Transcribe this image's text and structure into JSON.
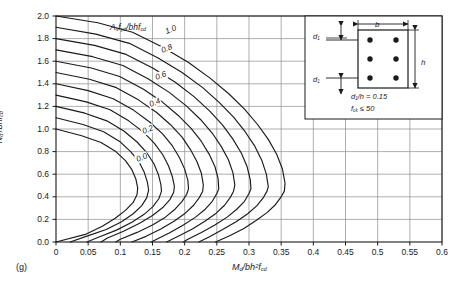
{
  "figure": {
    "panel_label": "(g)",
    "background": "#ffffff",
    "ink": "#1a1a1a",
    "grid_color": "#8c8c8c"
  },
  "chart_data": {
    "type": "line",
    "title": "",
    "subtitle": "",
    "xlabel": "Md/bh²fcd",
    "ylabel": "Nd/bhfcd",
    "xlim": [
      0,
      0.6
    ],
    "ylim": [
      0,
      2.0
    ],
    "xticks": [
      "0",
      "0.05",
      "0.1",
      "0.15",
      "0.2",
      "0.25",
      "0.3",
      "0.35",
      "0.4",
      "0.45",
      "0.5",
      "0.55",
      "0.6"
    ],
    "xtick_values": [
      0,
      0.05,
      0.1,
      0.15,
      0.2,
      0.25,
      0.3,
      0.35,
      0.4,
      0.45,
      0.5,
      0.55,
      0.6
    ],
    "yticks": [
      "0.0",
      "0.2",
      "0.4",
      "0.6",
      "0.8",
      "1.0",
      "1.2",
      "1.4",
      "1.6",
      "1.8",
      "2.0"
    ],
    "ytick_values": [
      0,
      0.2,
      0.4,
      0.6,
      0.8,
      1.0,
      1.2,
      1.4,
      1.6,
      1.8,
      2.0
    ],
    "grid": true,
    "legend_position": "inline-curve-labels",
    "family_label": "Asfyd/bhfcd",
    "labelled_curves": [
      "0.0",
      "0.2",
      "0.4",
      "0.6",
      "0.8",
      "1.0"
    ],
    "series": [
      {
        "name": "0.0",
        "label_shown": true,
        "points": [
          [
            0.0,
            1.0
          ],
          [
            0.04,
            0.94
          ],
          [
            0.07,
            0.88
          ],
          [
            0.093,
            0.8
          ],
          [
            0.108,
            0.72
          ],
          [
            0.118,
            0.64
          ],
          [
            0.124,
            0.56
          ],
          [
            0.127,
            0.48
          ],
          [
            0.126,
            0.42
          ],
          [
            0.12,
            0.35
          ],
          [
            0.108,
            0.28
          ],
          [
            0.092,
            0.21
          ],
          [
            0.072,
            0.14
          ],
          [
            0.047,
            0.07
          ],
          [
            0.0,
            0.0
          ]
        ]
      },
      {
        "name": "0.1",
        "label_shown": false,
        "points": [
          [
            0.0,
            1.1
          ],
          [
            0.042,
            1.04
          ],
          [
            0.074,
            0.975
          ],
          [
            0.099,
            0.89
          ],
          [
            0.116,
            0.8
          ],
          [
            0.129,
            0.71
          ],
          [
            0.137,
            0.62
          ],
          [
            0.142,
            0.53
          ],
          [
            0.144,
            0.46
          ],
          [
            0.141,
            0.39
          ],
          [
            0.133,
            0.32
          ],
          [
            0.12,
            0.25
          ],
          [
            0.102,
            0.18
          ],
          [
            0.078,
            0.11
          ],
          [
            0.047,
            0.05
          ],
          [
            0.022,
            0.0
          ]
        ]
      },
      {
        "name": "0.2",
        "label_shown": true,
        "points": [
          [
            0.0,
            1.2
          ],
          [
            0.045,
            1.14
          ],
          [
            0.079,
            1.072
          ],
          [
            0.106,
            0.98
          ],
          [
            0.126,
            0.885
          ],
          [
            0.141,
            0.79
          ],
          [
            0.152,
            0.695
          ],
          [
            0.159,
            0.6
          ],
          [
            0.163,
            0.51
          ],
          [
            0.164,
            0.45
          ],
          [
            0.16,
            0.385
          ],
          [
            0.151,
            0.315
          ],
          [
            0.137,
            0.245
          ],
          [
            0.118,
            0.175
          ],
          [
            0.094,
            0.105
          ],
          [
            0.065,
            0.04
          ],
          [
            0.048,
            0.0
          ]
        ]
      },
      {
        "name": "0.3",
        "label_shown": false,
        "points": [
          [
            0.0,
            1.3
          ],
          [
            0.047,
            1.24
          ],
          [
            0.084,
            1.17
          ],
          [
            0.113,
            1.072
          ],
          [
            0.136,
            0.972
          ],
          [
            0.153,
            0.872
          ],
          [
            0.166,
            0.772
          ],
          [
            0.175,
            0.672
          ],
          [
            0.181,
            0.575
          ],
          [
            0.184,
            0.495
          ],
          [
            0.183,
            0.44
          ],
          [
            0.177,
            0.375
          ],
          [
            0.166,
            0.305
          ],
          [
            0.15,
            0.235
          ],
          [
            0.13,
            0.165
          ],
          [
            0.105,
            0.095
          ],
          [
            0.08,
            0.035
          ],
          [
            0.07,
            0.0
          ]
        ]
      },
      {
        "name": "0.4",
        "label_shown": true,
        "points": [
          [
            0.0,
            1.4
          ],
          [
            0.05,
            1.34
          ],
          [
            0.089,
            1.268
          ],
          [
            0.121,
            1.165
          ],
          [
            0.146,
            1.06
          ],
          [
            0.166,
            0.955
          ],
          [
            0.181,
            0.85
          ],
          [
            0.192,
            0.745
          ],
          [
            0.2,
            0.645
          ],
          [
            0.205,
            0.545
          ],
          [
            0.206,
            0.47
          ],
          [
            0.203,
            0.42
          ],
          [
            0.196,
            0.36
          ],
          [
            0.185,
            0.29
          ],
          [
            0.17,
            0.22
          ],
          [
            0.15,
            0.15
          ],
          [
            0.126,
            0.085
          ],
          [
            0.1,
            0.025
          ],
          [
            0.093,
            0.0
          ]
        ]
      },
      {
        "name": "0.5",
        "label_shown": false,
        "points": [
          [
            0.0,
            1.5
          ],
          [
            0.052,
            1.44
          ],
          [
            0.094,
            1.366
          ],
          [
            0.128,
            1.258
          ],
          [
            0.156,
            1.148
          ],
          [
            0.178,
            1.038
          ],
          [
            0.196,
            0.928
          ],
          [
            0.209,
            0.818
          ],
          [
            0.219,
            0.712
          ],
          [
            0.226,
            0.608
          ],
          [
            0.229,
            0.505
          ],
          [
            0.228,
            0.45
          ],
          [
            0.223,
            0.395
          ],
          [
            0.214,
            0.325
          ],
          [
            0.201,
            0.255
          ],
          [
            0.184,
            0.185
          ],
          [
            0.163,
            0.115
          ],
          [
            0.14,
            0.05
          ],
          [
            0.118,
            0.0
          ]
        ]
      },
      {
        "name": "0.6",
        "label_shown": true,
        "points": [
          [
            0.0,
            1.6
          ],
          [
            0.055,
            1.54
          ],
          [
            0.099,
            1.464
          ],
          [
            0.136,
            1.352
          ],
          [
            0.166,
            1.236
          ],
          [
            0.19,
            1.12
          ],
          [
            0.21,
            1.005
          ],
          [
            0.226,
            0.89
          ],
          [
            0.238,
            0.778
          ],
          [
            0.247,
            0.668
          ],
          [
            0.252,
            0.56
          ],
          [
            0.253,
            0.47
          ],
          [
            0.25,
            0.43
          ],
          [
            0.243,
            0.36
          ],
          [
            0.232,
            0.29
          ],
          [
            0.217,
            0.22
          ],
          [
            0.198,
            0.15
          ],
          [
            0.176,
            0.08
          ],
          [
            0.155,
            0.02
          ],
          [
            0.148,
            0.0
          ]
        ]
      },
      {
        "name": "0.7",
        "label_shown": false,
        "points": [
          [
            0.0,
            1.7
          ],
          [
            0.057,
            1.64
          ],
          [
            0.104,
            1.562
          ],
          [
            0.143,
            1.445
          ],
          [
            0.176,
            1.324
          ],
          [
            0.203,
            1.202
          ],
          [
            0.225,
            1.082
          ],
          [
            0.243,
            0.962
          ],
          [
            0.257,
            0.844
          ],
          [
            0.268,
            0.728
          ],
          [
            0.275,
            0.614
          ],
          [
            0.278,
            0.505
          ],
          [
            0.276,
            0.45
          ],
          [
            0.271,
            0.395
          ],
          [
            0.262,
            0.325
          ],
          [
            0.249,
            0.255
          ],
          [
            0.232,
            0.185
          ],
          [
            0.212,
            0.115
          ],
          [
            0.19,
            0.05
          ],
          [
            0.172,
            0.0
          ]
        ]
      },
      {
        "name": "0.8",
        "label_shown": true,
        "points": [
          [
            0.0,
            1.8
          ],
          [
            0.06,
            1.74
          ],
          [
            0.109,
            1.66
          ],
          [
            0.151,
            1.538
          ],
          [
            0.186,
            1.412
          ],
          [
            0.215,
            1.284
          ],
          [
            0.239,
            1.158
          ],
          [
            0.259,
            1.034
          ],
          [
            0.275,
            0.91
          ],
          [
            0.288,
            0.788
          ],
          [
            0.297,
            0.668
          ],
          [
            0.302,
            0.55
          ],
          [
            0.303,
            0.47
          ],
          [
            0.3,
            0.43
          ],
          [
            0.293,
            0.36
          ],
          [
            0.281,
            0.29
          ],
          [
            0.266,
            0.22
          ],
          [
            0.247,
            0.15
          ],
          [
            0.226,
            0.085
          ],
          [
            0.205,
            0.025
          ],
          [
            0.198,
            0.0
          ]
        ]
      },
      {
        "name": "0.9",
        "label_shown": false,
        "points": [
          [
            0.0,
            1.9
          ],
          [
            0.062,
            1.84
          ],
          [
            0.114,
            1.758
          ],
          [
            0.158,
            1.631
          ],
          [
            0.196,
            1.5
          ],
          [
            0.228,
            1.366
          ],
          [
            0.254,
            1.234
          ],
          [
            0.276,
            1.105
          ],
          [
            0.294,
            0.976
          ],
          [
            0.309,
            0.848
          ],
          [
            0.32,
            0.722
          ],
          [
            0.327,
            0.598
          ],
          [
            0.33,
            0.49
          ],
          [
            0.328,
            0.45
          ],
          [
            0.322,
            0.39
          ],
          [
            0.312,
            0.32
          ],
          [
            0.298,
            0.25
          ],
          [
            0.28,
            0.18
          ],
          [
            0.259,
            0.11
          ],
          [
            0.238,
            0.045
          ],
          [
            0.222,
            0.0
          ]
        ]
      },
      {
        "name": "1.0",
        "label_shown": true,
        "points": [
          [
            0.0,
            2.0
          ],
          [
            0.065,
            1.94
          ],
          [
            0.119,
            1.856
          ],
          [
            0.166,
            1.724
          ],
          [
            0.206,
            1.588
          ],
          [
            0.24,
            1.448
          ],
          [
            0.269,
            1.31
          ],
          [
            0.293,
            1.176
          ],
          [
            0.313,
            1.042
          ],
          [
            0.33,
            0.908
          ],
          [
            0.343,
            0.776
          ],
          [
            0.352,
            0.646
          ],
          [
            0.356,
            0.52
          ],
          [
            0.355,
            0.45
          ],
          [
            0.35,
            0.4
          ],
          [
            0.341,
            0.33
          ],
          [
            0.328,
            0.26
          ],
          [
            0.311,
            0.19
          ],
          [
            0.292,
            0.12
          ],
          [
            0.27,
            0.055
          ],
          [
            0.248,
            0.0
          ]
        ]
      }
    ]
  },
  "inset": {
    "name": "cross-section-detail",
    "dim_b": "b",
    "dim_h": "h",
    "dim_d1_top": "d1",
    "dim_d1_bottom": "d1",
    "note_ratio": "d1/h = 0.15",
    "note_fck": "fck ≤ 50",
    "bar_count": 6,
    "bar_rows": 3,
    "bar_cols": 2
  }
}
